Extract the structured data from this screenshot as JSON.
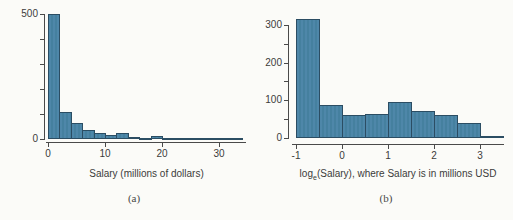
{
  "page": {
    "background": "#fbfbf8",
    "figure_type": "side-by-side histograms of MLB salaries, raw and log-transformed"
  },
  "chart_data": [
    {
      "type": "bar",
      "subtype": "histogram",
      "panel": "a",
      "caption": "(a)",
      "title": "",
      "xlabel": {
        "pre": "Salary (millions of dollars)",
        "sub": "",
        "post": ""
      },
      "ylabel": "",
      "bin_start": 0,
      "bin_width": 2,
      "counts": [
        500,
        110,
        63,
        35,
        24,
        16,
        24,
        10,
        6,
        14,
        4,
        2,
        1,
        1,
        1,
        1,
        2
      ],
      "xlim": [
        0,
        34.5
      ],
      "ylim": [
        0,
        500
      ],
      "x_ticks": [
        {
          "v": 0,
          "label": "0"
        },
        {
          "v": 10,
          "label": "10"
        },
        {
          "v": 20,
          "label": "20"
        },
        {
          "v": 30,
          "label": "30"
        }
      ],
      "y_ticks": [
        {
          "v": 0,
          "label": "0"
        },
        {
          "v": 100,
          "label": ""
        },
        {
          "v": 200,
          "label": ""
        },
        {
          "v": 300,
          "label": ""
        },
        {
          "v": 400,
          "label": ""
        },
        {
          "v": 500,
          "label": "500"
        }
      ],
      "grid": false,
      "legend": "none",
      "bar_fill": "#4e87a9",
      "bar_stripe": "#45809f",
      "bar_border": "#2b4d63"
    },
    {
      "type": "bar",
      "subtype": "histogram",
      "panel": "b",
      "caption": "(b)",
      "title": "",
      "xlabel": {
        "pre": "log",
        "sub": "e",
        "post": "(Salary), where Salary is in millions USD"
      },
      "ylabel": "",
      "bin_start": -1,
      "bin_width": 0.5,
      "counts": [
        315,
        88,
        60,
        65,
        95,
        72,
        62,
        40,
        4
      ],
      "xlim": [
        -1,
        3.55
      ],
      "ylim": [
        0,
        300
      ],
      "x_ticks": [
        {
          "v": -1,
          "label": "-1"
        },
        {
          "v": 0,
          "label": "0"
        },
        {
          "v": 1,
          "label": "1"
        },
        {
          "v": 2,
          "label": "2"
        },
        {
          "v": 3,
          "label": "3"
        }
      ],
      "y_ticks": [
        {
          "v": 0,
          "label": "0"
        },
        {
          "v": 50,
          "label": ""
        },
        {
          "v": 100,
          "label": "100"
        },
        {
          "v": 150,
          "label": ""
        },
        {
          "v": 200,
          "label": "200"
        },
        {
          "v": 250,
          "label": ""
        },
        {
          "v": 300,
          "label": "300"
        }
      ],
      "grid": false,
      "legend": "none",
      "bar_fill": "#4e87a9",
      "bar_stripe": "#45809f",
      "bar_border": "#2b4d63"
    }
  ]
}
